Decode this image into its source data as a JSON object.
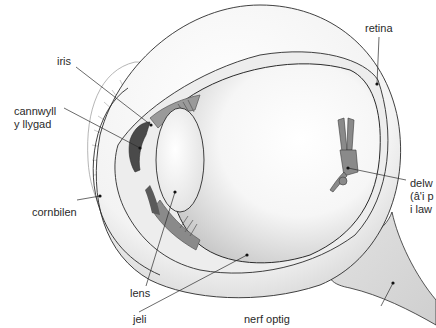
{
  "diagram": {
    "labels": {
      "iris": "iris",
      "pupil_line1": "cannwyll",
      "pupil_line2": "y llygad",
      "cornea": "cornbilen",
      "lens": "lens",
      "vitreous": "jeli",
      "optic_nerve": "nerf optig",
      "retina": "retina",
      "image_line1": "delw",
      "image_line2": "(â'i p",
      "image_line3": "i law"
    },
    "colors": {
      "outline": "#2b2b2b",
      "shade_light": "#e6e6e6",
      "shade_mid": "#bdbdbd",
      "shade_dark": "#6e6e6e",
      "figure": "#8a8a8a",
      "text": "#2a2a2a"
    }
  }
}
